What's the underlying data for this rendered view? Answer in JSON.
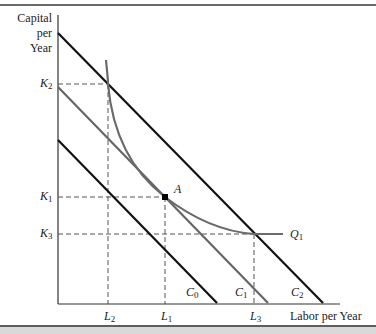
{
  "diagram": {
    "type": "isoquant-isocost",
    "y_axis_title": [
      "Capital",
      "per",
      "Year"
    ],
    "x_axis_title": "Labor per Year",
    "y_ticks": [
      {
        "base": "K",
        "sub": "2",
        "y": 84
      },
      {
        "base": "K",
        "sub": "1",
        "y": 197
      },
      {
        "base": "K",
        "sub": "3",
        "y": 234
      }
    ],
    "x_ticks": [
      {
        "base": "L",
        "sub": "2",
        "x": 108
      },
      {
        "base": "L",
        "sub": "1",
        "x": 165
      },
      {
        "base": "L",
        "sub": "3",
        "x": 254
      }
    ],
    "isocost_lines": [
      {
        "name": "C0",
        "base": "C",
        "sub": "0",
        "color": "#111111",
        "from": [
          58,
          140
        ],
        "to": [
          217,
          303
        ]
      },
      {
        "name": "C1",
        "base": "C",
        "sub": "1",
        "color": "#666666",
        "from": [
          58,
          87
        ],
        "to": [
          268,
          303
        ]
      },
      {
        "name": "C2",
        "base": "C",
        "sub": "2",
        "color": "#111111",
        "from": [
          58,
          33
        ],
        "to": [
          323,
          303
        ]
      }
    ],
    "isoquant": {
      "name": "Q1",
      "base": "Q",
      "sub": "1",
      "color": "#6a6a6a"
    },
    "point": {
      "label": "A",
      "x": 165,
      "y": 197
    },
    "colors": {
      "axis": "#333333",
      "dashed": "#555555",
      "dark_line": "#111111",
      "gray_line": "#666666",
      "bottom_bar": "#d9d9d9"
    }
  },
  "labels": {
    "y_title_1": "Capital",
    "y_title_2": "per",
    "y_title_3": "Year",
    "x_title": "Labor per Year",
    "k2_base": "K",
    "k2_sub": "2",
    "k1_base": "K",
    "k1_sub": "1",
    "k3_base": "K",
    "k3_sub": "3",
    "l2_base": "L",
    "l2_sub": "2",
    "l1_base": "L",
    "l1_sub": "1",
    "l3_base": "L",
    "l3_sub": "3",
    "c0_base": "C",
    "c0_sub": "0",
    "c1_base": "C",
    "c1_sub": "1",
    "c2_base": "C",
    "c2_sub": "2",
    "q1_base": "Q",
    "q1_sub": "1",
    "point_a": "A"
  }
}
